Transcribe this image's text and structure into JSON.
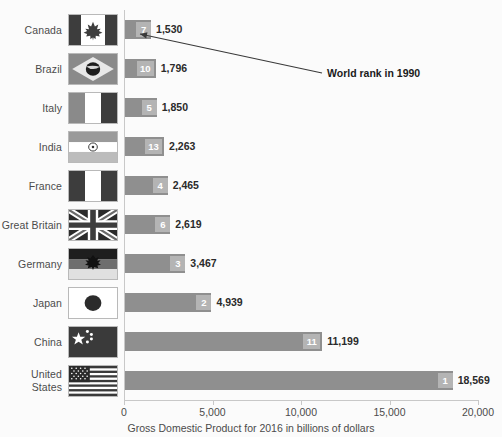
{
  "chart_data": {
    "type": "bar",
    "orientation": "horizontal",
    "title": "",
    "xlabel": "Gross Domestic Product for 2016 in billions of dollars",
    "ylabel": "",
    "xlim": [
      0,
      20000
    ],
    "xticks": [
      0,
      5000,
      10000,
      15000,
      20000
    ],
    "xtick_labels": [
      "0",
      "5,000",
      "10,000",
      "15,000",
      "20,000"
    ],
    "grid": false,
    "legend": false,
    "categories": [
      "Canada",
      "Brazil",
      "Italy",
      "India",
      "France",
      "Great Britain",
      "Germany",
      "Japan",
      "China",
      "United States"
    ],
    "values": [
      1530,
      1796,
      1850,
      2263,
      2465,
      2619,
      3467,
      4939,
      11199,
      18569
    ],
    "value_labels": [
      "1,530",
      "1,796",
      "1,850",
      "2,263",
      "2,465",
      "2,619",
      "3,467",
      "4,939",
      "11,199",
      "18,569"
    ],
    "series": [
      {
        "name": "Gross Domestic Product for 2016 in billions of dollars",
        "values": [
          1530,
          1796,
          1850,
          2263,
          2465,
          2619,
          3467,
          4939,
          11199,
          18569
        ]
      },
      {
        "name": "World rank in 1990",
        "values": [
          7,
          10,
          5,
          13,
          4,
          6,
          3,
          2,
          11,
          1
        ]
      }
    ],
    "rank_labels": [
      "7",
      "10",
      "5",
      "13",
      "4",
      "6",
      "3",
      "2",
      "11",
      "1"
    ],
    "annotation": "World rank in 1990",
    "bar_color": "#8f8f8f",
    "badge_color": "#b4b4b4",
    "badge_text_color": "#ffffff",
    "axis_color": "#c8c8c8",
    "text_color": "#4b4b4b",
    "background_color": "#fbfbfb"
  },
  "rows": [
    {
      "country": "Canada",
      "country_line1": "Canada",
      "country_line2": "",
      "value": 1530,
      "value_label": "1,530",
      "rank": "7",
      "flag": "flag-canada"
    },
    {
      "country": "Brazil",
      "country_line1": "Brazil",
      "country_line2": "",
      "value": 1796,
      "value_label": "1,796",
      "rank": "10",
      "flag": "flag-brazil"
    },
    {
      "country": "Italy",
      "country_line1": "Italy",
      "country_line2": "",
      "value": 1850,
      "value_label": "1,850",
      "rank": "5",
      "flag": "flag-italy"
    },
    {
      "country": "India",
      "country_line1": "India",
      "country_line2": "",
      "value": 2263,
      "value_label": "2,263",
      "rank": "13",
      "flag": "flag-india"
    },
    {
      "country": "France",
      "country_line1": "France",
      "country_line2": "",
      "value": 2465,
      "value_label": "2,465",
      "rank": "4",
      "flag": "flag-france"
    },
    {
      "country": "Great Britain",
      "country_line1": "Great Britain",
      "country_line2": "",
      "value": 2619,
      "value_label": "2,619",
      "rank": "6",
      "flag": "flag-great-britain"
    },
    {
      "country": "Germany",
      "country_line1": "Germany",
      "country_line2": "",
      "value": 3467,
      "value_label": "3,467",
      "rank": "3",
      "flag": "flag-germany"
    },
    {
      "country": "Japan",
      "country_line1": "Japan",
      "country_line2": "",
      "value": 4939,
      "value_label": "4,939",
      "rank": "2",
      "flag": "flag-japan"
    },
    {
      "country": "China",
      "country_line1": "China",
      "country_line2": "",
      "value": 11199,
      "value_label": "11,199",
      "rank": "11",
      "flag": "flag-china"
    },
    {
      "country": "United States",
      "country_line1": "United",
      "country_line2": "States",
      "value": 18569,
      "value_label": "18,569",
      "rank": "1",
      "flag": "flag-united-states"
    }
  ],
  "axis": {
    "ticks": [
      "0",
      "5,000",
      "10,000",
      "15,000",
      "20,000"
    ],
    "title": "Gross Domestic Product for 2016 in billions of dollars"
  },
  "annotation": {
    "text": "World rank in 1990"
  }
}
